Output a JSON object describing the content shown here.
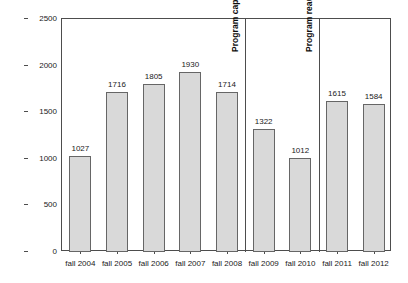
{
  "chart_data": {
    "type": "bar",
    "title": "",
    "subtitle": "",
    "xlabel": "",
    "ylabel": "OSP Scholarship Users",
    "categories": [
      "fall 2004",
      "fall 2005",
      "fall 2006",
      "fall 2007",
      "fall 2008",
      "fall 2009",
      "fall 2010",
      "fall 2011",
      "fall 2012"
    ],
    "values": [
      1027,
      1716,
      1805,
      1930,
      1714,
      1322,
      1012,
      1615,
      1584
    ],
    "data_labels": [
      "1027",
      "1716",
      "1805",
      "1930",
      "1714",
      "1322",
      "1012",
      "1615",
      "1584"
    ],
    "ylim": [
      0,
      2500
    ],
    "yticks": [
      0,
      500,
      1000,
      1500,
      2000,
      2500
    ],
    "ytick_labels": [
      "0",
      "500",
      "1000",
      "1500",
      "2000",
      "2500"
    ],
    "grid": false,
    "legend": "none",
    "bar_fill_color": "#d9d9d9",
    "bar_border_color": "#666666",
    "axis_color": "#4d4d4d",
    "text_color": "#1a1a1a",
    "annotations": [
      {
        "text": "Program capped in summer 2009",
        "after_category": "fall 2008"
      },
      {
        "text": "Program reauthorized in 2011",
        "after_category": "fall 2010"
      }
    ],
    "dividers": [
      {
        "after_category": "fall 2008"
      },
      {
        "after_category": "fall 2010"
      }
    ]
  }
}
